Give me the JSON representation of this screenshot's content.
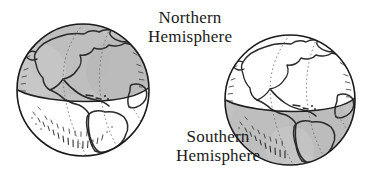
{
  "figure": {
    "caption_type": "earth-hemispheres-diagram",
    "background_color": "#ffffff",
    "ink_color": "#1a1a1a",
    "shade_color": "#bfbfbf",
    "land_fill": "#ffffff",
    "labels": {
      "northern": {
        "line1": "Northern",
        "line2": "Hemisphere"
      },
      "southern": {
        "line1": "Southern",
        "line2": "Hemisphere"
      }
    },
    "globes": [
      {
        "name": "left-globe",
        "highlighted_hemisphere": "Northern",
        "center_x": 83,
        "center_y": 90,
        "radius": 66,
        "equator_y": 97,
        "shaded_half": "top"
      },
      {
        "name": "right-globe",
        "highlighted_hemisphere": "Southern",
        "center_x": 290,
        "center_y": 100,
        "radius": 65,
        "equator_y": 104,
        "shaded_half": "bottom"
      }
    ]
  }
}
